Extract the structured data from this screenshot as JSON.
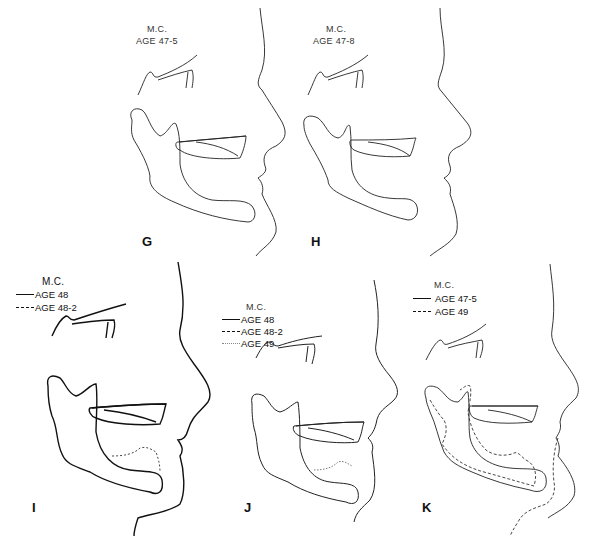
{
  "figure": {
    "subject": "M.C.",
    "panels": [
      {
        "id": "G",
        "letter": "G",
        "subject": "M.C.",
        "legend": [
          {
            "style": "none",
            "label": "AGE 47-5"
          }
        ]
      },
      {
        "id": "H",
        "letter": "H",
        "subject": "M.C.",
        "legend": [
          {
            "style": "none",
            "label": "AGE 47-8"
          }
        ]
      },
      {
        "id": "I",
        "letter": "I",
        "subject": "M.C.",
        "legend": [
          {
            "style": "solid",
            "label": "AGE 48"
          },
          {
            "style": "dashed",
            "label": "AGE 48-2"
          }
        ]
      },
      {
        "id": "J",
        "letter": "J",
        "subject": "M.C.",
        "legend": [
          {
            "style": "solid",
            "label": "AGE 48"
          },
          {
            "style": "dashed",
            "label": "AGE 48-2"
          },
          {
            "style": "dotted",
            "label": "AGE 49"
          }
        ]
      },
      {
        "id": "K",
        "letter": "K",
        "subject": "M.C.",
        "legend": [
          {
            "style": "solid",
            "label": "AGE 47-5"
          },
          {
            "style": "dashed",
            "label": "AGE 49"
          }
        ]
      }
    ]
  }
}
